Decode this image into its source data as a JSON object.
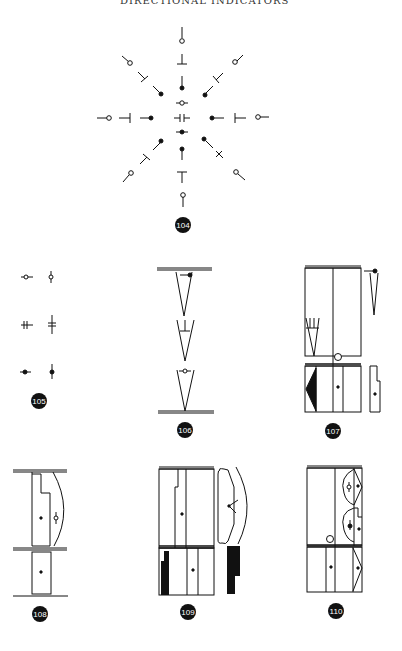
{
  "header": {
    "running_head": "DIRECTIONAL INDICATORS"
  },
  "figures": [
    {
      "id": "104",
      "label": "104",
      "description": "Radial arrangement of directional door/swing symbols (open circle, tee, dot) in eight directions around central symbols"
    },
    {
      "id": "105",
      "label": "105",
      "description": "Symbol pairs: horizontal and vertical open circle, double bar, filled dot"
    },
    {
      "id": "106",
      "label": "106",
      "description": "Three stacked V-shaped swing wedges between two double rails with dot, tee, and open-circle indicators"
    },
    {
      "id": "107",
      "label": "107",
      "description": "Cabinet elevation with upper and lower sections, black triangle, circle, side wedge and profile"
    },
    {
      "id": "108",
      "label": "108",
      "description": "Stepped panel with curved swing arc and open-circle indicator, lower panel with dot"
    },
    {
      "id": "109",
      "label": "109",
      "description": "Cabinet elevation with rounded side profile, arc, black strips in lower section"
    },
    {
      "id": "110",
      "label": "110",
      "description": "Cabinet elevation with semicircular swing areas, open circle and dot indicators, lower triangular panel"
    }
  ],
  "colors": {
    "ink": "#111111",
    "paper": "#ffffff"
  }
}
